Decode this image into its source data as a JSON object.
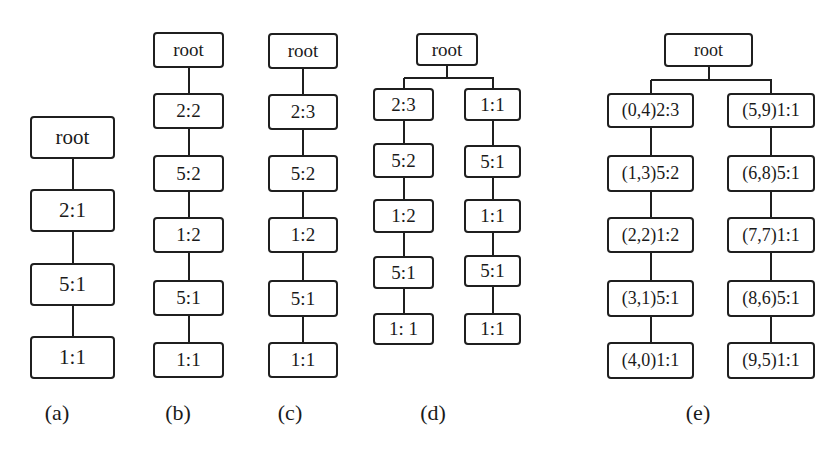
{
  "figure": {
    "panels": [
      {
        "id": "a",
        "caption": "(a)",
        "caption_pos": [
          57,
          413
        ],
        "font_class": "big",
        "columns": [
          {
            "nodes": [
              {
                "label": "root",
                "x": 30,
                "y": 116,
                "w": 85,
                "h": 43
              },
              {
                "label": "2:1",
                "x": 30,
                "y": 189,
                "w": 85,
                "h": 43
              },
              {
                "label": "5:1",
                "x": 30,
                "y": 263,
                "w": 85,
                "h": 43
              },
              {
                "label": "1:1",
                "x": 30,
                "y": 336,
                "w": 85,
                "h": 43
              }
            ]
          }
        ]
      },
      {
        "id": "b",
        "caption": "(b)",
        "caption_pos": [
          178,
          413
        ],
        "font_class": "",
        "columns": [
          {
            "nodes": [
              {
                "label": "root",
                "x": 153,
                "y": 32,
                "w": 71,
                "h": 36
              },
              {
                "label": "2:2",
                "x": 153,
                "y": 93,
                "w": 71,
                "h": 36
              },
              {
                "label": "5:2",
                "x": 153,
                "y": 155,
                "w": 71,
                "h": 37
              },
              {
                "label": "1:2",
                "x": 153,
                "y": 217,
                "w": 71,
                "h": 36
              },
              {
                "label": "5:1",
                "x": 153,
                "y": 280,
                "w": 71,
                "h": 36
              },
              {
                "label": "1:1",
                "x": 153,
                "y": 342,
                "w": 71,
                "h": 36
              }
            ]
          }
        ]
      },
      {
        "id": "c",
        "caption": "(c)",
        "caption_pos": [
          290,
          413
        ],
        "font_class": "",
        "columns": [
          {
            "nodes": [
              {
                "label": "root",
                "x": 268,
                "y": 33,
                "w": 70,
                "h": 36
              },
              {
                "label": "2:3",
                "x": 268,
                "y": 94,
                "w": 70,
                "h": 36
              },
              {
                "label": "5:2",
                "x": 268,
                "y": 155,
                "w": 70,
                "h": 37
              },
              {
                "label": "1:2",
                "x": 268,
                "y": 217,
                "w": 70,
                "h": 36
              },
              {
                "label": "5:1",
                "x": 268,
                "y": 280,
                "w": 70,
                "h": 37
              },
              {
                "label": "1:1",
                "x": 268,
                "y": 342,
                "w": 70,
                "h": 36
              }
            ]
          }
        ]
      },
      {
        "id": "d",
        "caption": "(d)",
        "caption_pos": [
          433,
          413
        ],
        "font_class": "",
        "root": {
          "label": "root",
          "x": 416,
          "y": 33,
          "w": 62,
          "h": 33
        },
        "branch_y": 78,
        "columns": [
          {
            "nodes": [
              {
                "label": "2:3",
                "x": 373,
                "y": 88,
                "w": 61,
                "h": 33
              },
              {
                "label": "5:2",
                "x": 373,
                "y": 143,
                "w": 61,
                "h": 35
              },
              {
                "label": "1:2",
                "x": 373,
                "y": 199,
                "w": 61,
                "h": 34
              },
              {
                "label": "5:1",
                "x": 373,
                "y": 256,
                "w": 61,
                "h": 33
              },
              {
                "label": "1: 1",
                "x": 373,
                "y": 313,
                "w": 61,
                "h": 32
              }
            ]
          },
          {
            "nodes": [
              {
                "label": "1:1",
                "x": 464,
                "y": 88,
                "w": 57,
                "h": 33
              },
              {
                "label": "5:1",
                "x": 464,
                "y": 145,
                "w": 57,
                "h": 33
              },
              {
                "label": "1:1",
                "x": 464,
                "y": 199,
                "w": 57,
                "h": 34
              },
              {
                "label": "5:1",
                "x": 464,
                "y": 255,
                "w": 57,
                "h": 32
              },
              {
                "label": "1:1",
                "x": 464,
                "y": 313,
                "w": 57,
                "h": 32
              }
            ]
          }
        ]
      },
      {
        "id": "e",
        "caption": "(e)",
        "caption_pos": [
          698,
          413
        ],
        "font_class": "e",
        "root": {
          "label": "root",
          "x": 664,
          "y": 33,
          "w": 89,
          "h": 34
        },
        "branch_y": 80,
        "columns": [
          {
            "nodes": [
              {
                "label": "(0,4)2:3",
                "x": 607,
                "y": 93,
                "w": 87,
                "h": 35
              },
              {
                "label": "(1,3)5:2",
                "x": 607,
                "y": 155,
                "w": 87,
                "h": 37
              },
              {
                "label": "(2,2)1:2",
                "x": 607,
                "y": 217,
                "w": 87,
                "h": 36
              },
              {
                "label": "(3,1)5:1",
                "x": 607,
                "y": 280,
                "w": 87,
                "h": 37
              },
              {
                "label": "(4,0)1:1",
                "x": 607,
                "y": 342,
                "w": 87,
                "h": 37
              }
            ]
          },
          {
            "nodes": [
              {
                "label": "(5,9)1:1",
                "x": 727,
                "y": 93,
                "w": 88,
                "h": 35
              },
              {
                "label": "(6,8)5:1",
                "x": 727,
                "y": 155,
                "w": 88,
                "h": 37
              },
              {
                "label": "(7,7)1:1",
                "x": 727,
                "y": 217,
                "w": 88,
                "h": 36
              },
              {
                "label": "(8,6)5:1",
                "x": 727,
                "y": 280,
                "w": 88,
                "h": 37
              },
              {
                "label": "(9,5)1:1",
                "x": 727,
                "y": 342,
                "w": 88,
                "h": 37
              }
            ]
          }
        ]
      }
    ]
  }
}
